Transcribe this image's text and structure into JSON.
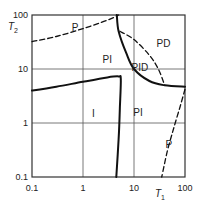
{
  "diagram": {
    "type": "log-log region diagram",
    "x_axis": {
      "label": "T",
      "subscript": "1",
      "scale": "log",
      "range": [
        0.1,
        100
      ],
      "ticks": [
        "0.1",
        "1",
        "10",
        "100"
      ]
    },
    "y_axis": {
      "label": "T",
      "subscript": "2",
      "scale": "log",
      "range": [
        0.1,
        100
      ],
      "ticks": [
        "0.1",
        "1",
        "10",
        "100"
      ]
    },
    "grid": true,
    "regions": [
      {
        "id": "p-top",
        "label": "P",
        "at": [
          0.7,
          60
        ]
      },
      {
        "id": "pi-top",
        "label": "PI",
        "at": [
          3.0,
          15
        ]
      },
      {
        "id": "pd",
        "label": "PD",
        "at": [
          38,
          30
        ]
      },
      {
        "id": "pid",
        "label": "PID",
        "at": [
          13,
          11
        ]
      },
      {
        "id": "i",
        "label": "I",
        "at": [
          1.6,
          1.5
        ]
      },
      {
        "id": "pi-right",
        "label": "PI",
        "at": [
          12,
          1.6
        ]
      },
      {
        "id": "p-right",
        "label": "P",
        "at": [
          48,
          0.4
        ]
      }
    ],
    "curves": [
      {
        "id": "p-pi-boundary",
        "style": "dashed",
        "points": [
          [
            0.1,
            32
          ],
          [
            0.3,
            40
          ],
          [
            1,
            56
          ],
          [
            3,
            80
          ],
          [
            5,
            100
          ]
        ]
      },
      {
        "id": "pi-pid-boundary",
        "style": "solid",
        "points": [
          [
            4.6,
            100
          ],
          [
            5,
            50
          ],
          [
            7,
            20
          ],
          [
            10,
            10
          ],
          [
            20,
            6
          ],
          [
            40,
            5
          ],
          [
            100,
            4.7
          ]
        ]
      },
      {
        "id": "pd-pid-boundary",
        "style": "dashed",
        "points": [
          [
            5.3,
            50
          ],
          [
            10,
            35
          ],
          [
            20,
            18
          ],
          [
            30,
            10
          ],
          [
            40,
            5
          ]
        ]
      },
      {
        "id": "i-boundary",
        "style": "solid",
        "points": [
          [
            0.1,
            4
          ],
          [
            0.3,
            4.7
          ],
          [
            1,
            5.8
          ],
          [
            3,
            7
          ],
          [
            5,
            7.3
          ],
          [
            5.5,
            6.5
          ],
          [
            5.3,
            2
          ],
          [
            5,
            0.5
          ],
          [
            4.5,
            0.1
          ]
        ]
      },
      {
        "id": "pi-p-boundary",
        "style": "dashed",
        "points": [
          [
            100,
            4.2
          ],
          [
            80,
            2
          ],
          [
            60,
            0.8
          ],
          [
            45,
            0.3
          ],
          [
            35,
            0.1
          ]
        ]
      }
    ]
  }
}
